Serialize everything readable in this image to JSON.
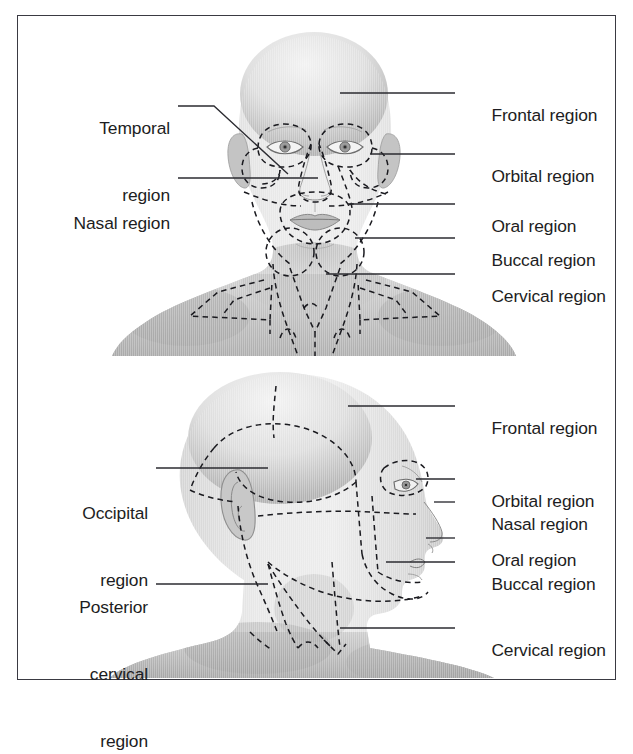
{
  "figure": {
    "border_color": "#3a3a42",
    "background": "#ffffff",
    "skin_light": "#ececec",
    "skin_mid": "#d4d4d4",
    "skin_dark": "#9a9a9a",
    "line_color": "#1a1a1f"
  },
  "panels": [
    {
      "id": "anterior",
      "view": "anterior-frontal-view",
      "labels_right": [
        {
          "key": "frontal",
          "text": "Frontal region"
        },
        {
          "key": "orbital",
          "text": "Orbital region"
        },
        {
          "key": "oral",
          "text": "Oral region"
        },
        {
          "key": "buccal",
          "text": "Buccal region"
        },
        {
          "key": "cervical",
          "text": "Cervical region"
        }
      ],
      "labels_left": [
        {
          "key": "temporal",
          "line1": "Temporal",
          "line2": "region"
        },
        {
          "key": "nasal",
          "line1": "Nasal region",
          "line2": ""
        }
      ]
    },
    {
      "id": "lateral",
      "view": "lateral-profile-view",
      "labels_right": [
        {
          "key": "frontal",
          "text": "Frontal region"
        },
        {
          "key": "orbital",
          "text": "Orbital region"
        },
        {
          "key": "nasal",
          "text": "Nasal region"
        },
        {
          "key": "oral",
          "text": "Oral region"
        },
        {
          "key": "buccal",
          "text": "Buccal region"
        },
        {
          "key": "cervical",
          "text": "Cervical region"
        }
      ],
      "labels_left": [
        {
          "key": "occipital",
          "line1": "Occipital",
          "line2": "region",
          "line3": ""
        },
        {
          "key": "posterior-cervical",
          "line1": "Posterior",
          "line2": "cervical",
          "line3": "region"
        }
      ]
    }
  ]
}
